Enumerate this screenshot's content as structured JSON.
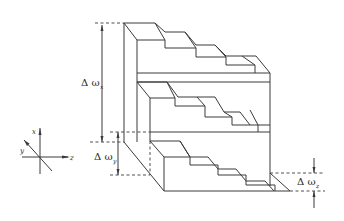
{
  "diagram": {
    "type": "isometric-stepped-block",
    "tiers": 3,
    "steps_per_tier": 5,
    "dimensions": {
      "delta_x": {
        "symbol": "Δ ω",
        "subscript": "x"
      },
      "delta_y": {
        "symbol": "Δ ω",
        "subscript": "y"
      },
      "delta_z": {
        "symbol": "Δ ω",
        "subscript": "z"
      }
    },
    "axes": {
      "x": "x",
      "y": "y",
      "z": "z"
    },
    "colors": {
      "line": "#3a3a3a",
      "background": "#ffffff"
    }
  }
}
